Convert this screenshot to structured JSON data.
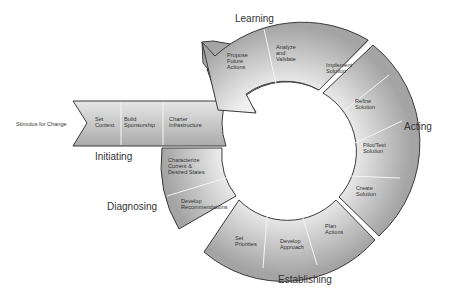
{
  "diagram": {
    "type": "cycle",
    "stimulus": "Stimulus for Change",
    "phases": [
      {
        "name": "Initiating",
        "steps": [
          "Set Context",
          "Build Sponsorship",
          "Charter Infrastructure"
        ]
      },
      {
        "name": "Diagnosing",
        "steps": [
          "Characterize Current & Desired States",
          "Develop Recommendations"
        ]
      },
      {
        "name": "Establishing",
        "steps": [
          "Set Priorities",
          "Develop Approach",
          "Plan Actions"
        ]
      },
      {
        "name": "Acting",
        "steps": [
          "Create Solution",
          "Pilot/Test Solution",
          "Refine Solution",
          "Implement Solution"
        ]
      },
      {
        "name": "Learning",
        "steps": [
          "Analyze and Validate",
          "Propose Future Actions"
        ]
      }
    ]
  },
  "labels": {
    "stimulus": "Stimulus for Change",
    "initiating": "Initiating",
    "diagnosing": "Diagnosing",
    "establishing": "Establishing",
    "acting": "Acting",
    "learning": "Learning",
    "set_context": [
      "Set",
      "Context"
    ],
    "build_sponsorship": [
      "Build",
      "Sponsorship"
    ],
    "charter_infrastructure": [
      "Charter",
      "Infrastructure"
    ],
    "characterize": [
      "Characterize",
      "Current &",
      "Desired States"
    ],
    "develop_recommendations": [
      "Develop",
      "Recommendations"
    ],
    "set_priorities": [
      "Set",
      "Priorities"
    ],
    "develop_approach": [
      "Develop",
      "Approach"
    ],
    "plan_actions": [
      "Plan",
      "Actions"
    ],
    "create_solution": [
      "Create",
      "Solution"
    ],
    "pilot_test": [
      "Pilot/Test",
      "Solution"
    ],
    "refine_solution": [
      "Refine",
      "Solution"
    ],
    "implement_solution": [
      "Implement",
      "Solution"
    ],
    "analyze_validate": [
      "Analyze",
      "and",
      "Validate"
    ],
    "propose_future": [
      "Propose",
      "Future",
      "Actions"
    ]
  },
  "colors": {
    "fill_light": "#e8e8e8",
    "fill_dark": "#a9a9a9",
    "stroke": "#3a3a3a",
    "text": "#333333"
  }
}
